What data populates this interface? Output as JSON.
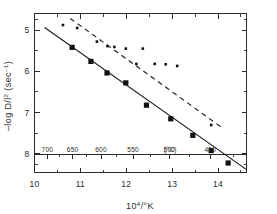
{
  "chart_data": {
    "type": "scatter",
    "title": "",
    "xlabel": "10⁴/°K",
    "ylabel": "-log D/l² (sec⁻¹)",
    "xlim": [
      10,
      14.62
    ],
    "ylim": [
      4.6,
      8.45
    ],
    "y_inverted": true,
    "grid": false,
    "legend": "none",
    "frame": "box",
    "axes": {
      "x_ticks": [
        10,
        11,
        12,
        13,
        14
      ],
      "x_tick_labels": [
        "10",
        "11",
        "12",
        "13",
        "14"
      ],
      "x_minor_ticks": [
        10.5,
        11.5,
        12.5,
        13.5,
        14.5
      ],
      "y_ticks": [
        5,
        6,
        7,
        8
      ],
      "y_tick_labels": [
        "5",
        "6",
        "7",
        "8"
      ],
      "y_minor_ticks": [
        4.75,
        5.5,
        6.5,
        7.5,
        8.25
      ]
    },
    "secondary_x_axis": {
      "label": "(°C)",
      "label_position_x": 12.96,
      "tick_values_celsius": [
        700,
        650,
        600,
        550,
        500,
        450
      ],
      "tick_labels": [
        "700",
        "650",
        "600",
        "550",
        "500",
        "450"
      ],
      "tick_positions_x": [
        10.28,
        10.83,
        11.45,
        12.15,
        12.94,
        13.83
      ],
      "minor_tick_positions_x": [
        10.55,
        11.13,
        11.79,
        12.53,
        13.37,
        14.33
      ]
    },
    "series": [
      {
        "name": "lower-series-solid-line",
        "marker": "filled-square",
        "line_style": "solid",
        "points": [
          {
            "x": 10.82,
            "y": 5.42
          },
          {
            "x": 11.23,
            "y": 5.76
          },
          {
            "x": 11.58,
            "y": 6.04
          },
          {
            "x": 11.99,
            "y": 6.28
          },
          {
            "x": 12.44,
            "y": 6.82
          },
          {
            "x": 12.97,
            "y": 7.15
          },
          {
            "x": 13.45,
            "y": 7.55
          },
          {
            "x": 13.85,
            "y": 7.92
          },
          {
            "x": 14.22,
            "y": 8.22
          }
        ],
        "fit_line": {
          "x1": 10.22,
          "y1": 4.94,
          "x2": 14.62,
          "y2": 8.38
        }
      },
      {
        "name": "upper-series-dashed-line",
        "marker": "small-dot",
        "line_style": "dashed",
        "points": [
          {
            "x": 10.62,
            "y": 4.88
          },
          {
            "x": 10.93,
            "y": 4.95
          },
          {
            "x": 11.36,
            "y": 5.28
          },
          {
            "x": 11.59,
            "y": 5.39
          },
          {
            "x": 11.74,
            "y": 5.41
          },
          {
            "x": 11.99,
            "y": 5.45
          },
          {
            "x": 12.22,
            "y": 5.82
          },
          {
            "x": 12.36,
            "y": 5.45
          },
          {
            "x": 12.62,
            "y": 5.82
          },
          {
            "x": 12.86,
            "y": 5.83
          },
          {
            "x": 13.11,
            "y": 5.87
          },
          {
            "x": 13.85,
            "y": 7.3
          }
        ],
        "fit_line": {
          "x1": 10.78,
          "y1": 4.72,
          "x2": 14.08,
          "y2": 7.36
        }
      }
    ]
  }
}
